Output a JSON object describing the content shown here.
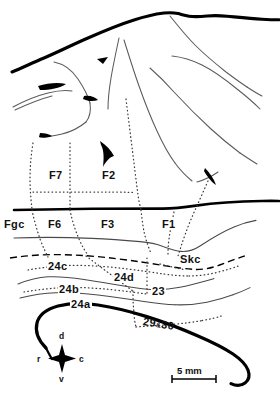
{
  "figure": {
    "kind": "brain-cytoarchitectonic-map",
    "view": "medial-surface",
    "background_color": "#ffffff",
    "ink_color": "#000000",
    "sulcus_line_color": "#555555"
  },
  "areas": [
    {
      "id": "F7",
      "label": "F7",
      "x": 48,
      "y": 170
    },
    {
      "id": "F2",
      "label": "F2",
      "x": 101,
      "y": 170
    },
    {
      "id": "Fgc",
      "label": "Fgc",
      "x": 3,
      "y": 219
    },
    {
      "id": "F6",
      "label": "F6",
      "x": 47,
      "y": 219
    },
    {
      "id": "F3",
      "label": "F3",
      "x": 100,
      "y": 219
    },
    {
      "id": "F1",
      "label": "F1",
      "x": 161,
      "y": 219
    },
    {
      "id": "Skc",
      "label": "Skc",
      "x": 179,
      "y": 254
    },
    {
      "id": "24c",
      "label": "24c",
      "x": 47,
      "y": 261
    },
    {
      "id": "24d",
      "label": "24d",
      "x": 113,
      "y": 272
    },
    {
      "id": "24b",
      "label": "24b",
      "x": 58,
      "y": 284
    },
    {
      "id": "23",
      "label": "23",
      "x": 151,
      "y": 286
    },
    {
      "id": "24a",
      "label": "24a",
      "x": 70,
      "y": 299
    }
  ],
  "area_combined": {
    "id": "29-and-30",
    "first": "29",
    "ampersand": "&",
    "second": "30",
    "x": 143,
    "y": 316
  },
  "compass": {
    "name": "orientation-compass",
    "center_x": 62,
    "center_y": 359,
    "dorsal": "d",
    "ventral": "v",
    "rostral": "r",
    "caudal": "c"
  },
  "scale_bar": {
    "name": "scale-bar",
    "label": "5 mm",
    "x": 172,
    "y": 367,
    "length_px": 44
  }
}
